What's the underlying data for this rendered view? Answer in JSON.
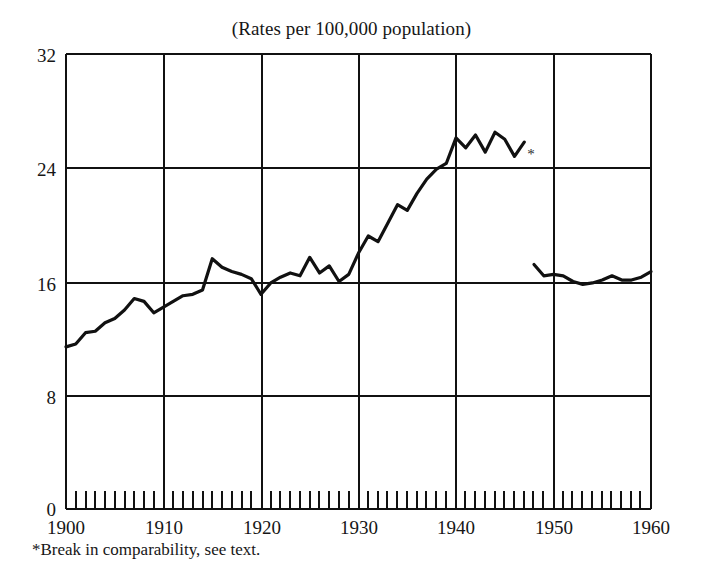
{
  "figure": {
    "title": "(Rates per 100,000 population)",
    "footnote": "*Break in comparability, see text.",
    "asterisk_marker": "*",
    "line_color": "#111111",
    "axis_color": "#111111",
    "background_color": "#ffffff"
  },
  "chart_data": {
    "type": "line",
    "title": "(Rates per 100,000 population)",
    "subtitle": "",
    "xlabel": "",
    "ylabel": "",
    "xlim": [
      1900,
      1960
    ],
    "ylim": [
      0,
      32
    ],
    "yticks": [
      0,
      8,
      16,
      24,
      32
    ],
    "ytick_labels": [
      "0",
      "8",
      "16",
      "24",
      "32"
    ],
    "xticks": [
      1900,
      1910,
      1920,
      1930,
      1940,
      1950,
      1960
    ],
    "xtick_labels": [
      "1900",
      "1910",
      "1920",
      "1930",
      "1940",
      "1950",
      "1960"
    ],
    "xminor_tick_interval": 1,
    "grid": true,
    "grid_style": "major-both-axes",
    "legend": false,
    "legend_position": "none",
    "annotations": [
      {
        "text": "*",
        "x": 1947.7,
        "y": 25.0,
        "note": "Break in comparability, see text."
      }
    ],
    "series": [
      {
        "name": "Rate before break",
        "x": [
          1900,
          1901,
          1902,
          1903,
          1904,
          1905,
          1906,
          1907,
          1908,
          1909,
          1910,
          1911,
          1912,
          1913,
          1914,
          1915,
          1916,
          1917,
          1918,
          1919,
          1920,
          1921,
          1922,
          1923,
          1924,
          1925,
          1926,
          1927,
          1928,
          1929,
          1930,
          1931,
          1932,
          1933,
          1934,
          1935,
          1936,
          1937,
          1938,
          1939,
          1940,
          1941,
          1942,
          1943,
          1944,
          1945,
          1946,
          1947
        ],
        "values": [
          11.4,
          11.6,
          12.4,
          12.5,
          13.1,
          13.4,
          14.0,
          14.8,
          14.6,
          13.8,
          14.2,
          14.6,
          15.0,
          15.1,
          15.4,
          17.6,
          17.0,
          16.7,
          16.5,
          16.2,
          15.1,
          15.9,
          16.3,
          16.6,
          16.4,
          17.7,
          16.6,
          17.1,
          16.0,
          16.5,
          18.0,
          19.2,
          18.8,
          20.1,
          21.4,
          21.0,
          22.2,
          23.2,
          23.9,
          24.3,
          26.1,
          25.4,
          26.3,
          25.1,
          26.5,
          26.0,
          24.8,
          25.8
        ]
      },
      {
        "name": "Rate after break",
        "x": [
          1948,
          1949,
          1950,
          1951,
          1952,
          1953,
          1954,
          1955,
          1956,
          1957,
          1958,
          1959,
          1960
        ],
        "values": [
          17.2,
          16.4,
          16.5,
          16.4,
          16.0,
          15.8,
          15.9,
          16.1,
          16.4,
          16.1,
          16.1,
          16.3,
          16.7
        ]
      }
    ]
  }
}
